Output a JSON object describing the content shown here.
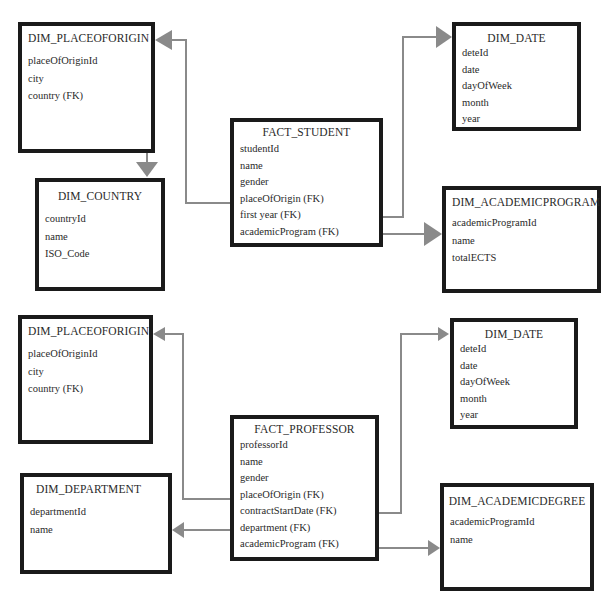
{
  "colors": {
    "box_border": "#1a1a1a",
    "connector": "#8a8a8a",
    "text": "#2a2a2a"
  },
  "student_schema": {
    "dim_placeoforigin": {
      "title": "DIM_PLACEOFORIGIN",
      "fields": [
        "placeOfOriginId",
        "city",
        "country (FK)"
      ]
    },
    "dim_country": {
      "title": "DIM_COUNTRY",
      "fields": [
        "countryId",
        "name",
        "ISO_Code"
      ]
    },
    "fact_student": {
      "title": "FACT_STUDENT",
      "fields": [
        "studentId",
        "name",
        "gender",
        "placeOfOrigin (FK)",
        "first year (FK)",
        "academicProgram (FK)"
      ]
    },
    "dim_date": {
      "title": "DIM_DATE",
      "fields": [
        "deteId",
        "date",
        "dayOfWeek",
        "month",
        "year"
      ]
    },
    "dim_academicprogram": {
      "title": "DIM_ACADEMICPROGRAM",
      "fields": [
        "academicProgramId",
        "name",
        "totalECTS"
      ]
    }
  },
  "professor_schema": {
    "dim_placeoforigin": {
      "title": "DIM_PLACEOFORIGIN",
      "fields": [
        "placeOfOriginId",
        "city",
        "country (FK)"
      ]
    },
    "dim_department": {
      "title": "DIM_DEPARTMENT",
      "fields": [
        "departmentId",
        "name"
      ]
    },
    "fact_professor": {
      "title": "FACT_PROFESSOR",
      "fields": [
        "professorId",
        "name",
        "gender",
        "placeOfOrigin (FK)",
        "contractStartDate (FK)",
        "department (FK)",
        "academicProgram (FK)"
      ]
    },
    "dim_date": {
      "title": "DIM_DATE",
      "fields": [
        "deteId",
        "date",
        "dayOfWeek",
        "month",
        "year"
      ]
    },
    "dim_academicdegree": {
      "title": "DIM_ACADEMICDEGREE",
      "fields": [
        "academicProgramId",
        "name"
      ]
    }
  },
  "relationships": [
    {
      "from": "FACT_STUDENT.placeOfOrigin (FK)",
      "to": "DIM_PLACEOFORIGIN"
    },
    {
      "from": "DIM_PLACEOFORIGIN.country (FK)",
      "to": "DIM_COUNTRY"
    },
    {
      "from": "FACT_STUDENT.first year (FK)",
      "to": "DIM_DATE"
    },
    {
      "from": "FACT_STUDENT.academicProgram (FK)",
      "to": "DIM_ACADEMICPROGRAM"
    },
    {
      "from": "FACT_PROFESSOR.placeOfOrigin (FK)",
      "to": "DIM_PLACEOFORIGIN"
    },
    {
      "from": "FACT_PROFESSOR.contractStartDate (FK)",
      "to": "DIM_DATE"
    },
    {
      "from": "FACT_PROFESSOR.department (FK)",
      "to": "DIM_DEPARTMENT"
    },
    {
      "from": "FACT_PROFESSOR.academicProgram (FK)",
      "to": "DIM_ACADEMICDEGREE"
    }
  ]
}
